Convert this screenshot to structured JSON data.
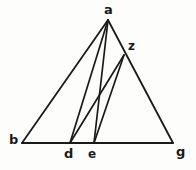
{
  "figure": {
    "kind": "euclidean-geometry-diagram",
    "canvas": {
      "width": 196,
      "height": 170
    },
    "ink_color": "#1c1a18",
    "background_color": "#fdfdfc",
    "stroke_width": 1.7,
    "points": [
      {
        "id": "a",
        "label": "a",
        "x": 108,
        "y": 20,
        "label_x": 104,
        "label_y": 3,
        "label_size": 13
      },
      {
        "id": "z",
        "label": "z",
        "x": 124,
        "y": 55,
        "label_x": 128,
        "label_y": 40,
        "label_size": 12
      },
      {
        "id": "b",
        "label": "b",
        "x": 22,
        "y": 143,
        "label_x": 9,
        "label_y": 133,
        "label_size": 13
      },
      {
        "id": "d",
        "label": "d",
        "x": 70,
        "y": 143,
        "label_x": 64,
        "label_y": 147,
        "label_size": 13
      },
      {
        "id": "e",
        "label": "e",
        "x": 94,
        "y": 143,
        "label_x": 88,
        "label_y": 148,
        "label_size": 12
      },
      {
        "id": "g",
        "label": "g",
        "x": 173,
        "y": 143,
        "label_x": 176,
        "label_y": 145,
        "label_size": 13
      }
    ],
    "segments": [
      {
        "id": "b-g",
        "name": "base-line-b-g",
        "from": "b",
        "to": "g",
        "width": 1.8
      },
      {
        "id": "a-b",
        "name": "side-line-a-b",
        "from": "a",
        "to": "b",
        "width": 1.8
      },
      {
        "id": "a-g",
        "name": "side-line-a-g",
        "from": "a",
        "to": "g",
        "width": 1.8
      },
      {
        "id": "a-d",
        "name": "cevian-line-a-d",
        "from": "a",
        "to": "d",
        "width": 1.7
      },
      {
        "id": "a-e",
        "name": "cevian-line-a-e",
        "from": "a",
        "to": "e",
        "width": 1.7
      },
      {
        "id": "z-d",
        "name": "cevian-line-z-d",
        "from": "z",
        "to": "d",
        "width": 1.7
      },
      {
        "id": "z-e",
        "name": "cevian-line-z-e",
        "from": "z",
        "to": "e",
        "width": 1.7
      }
    ]
  }
}
